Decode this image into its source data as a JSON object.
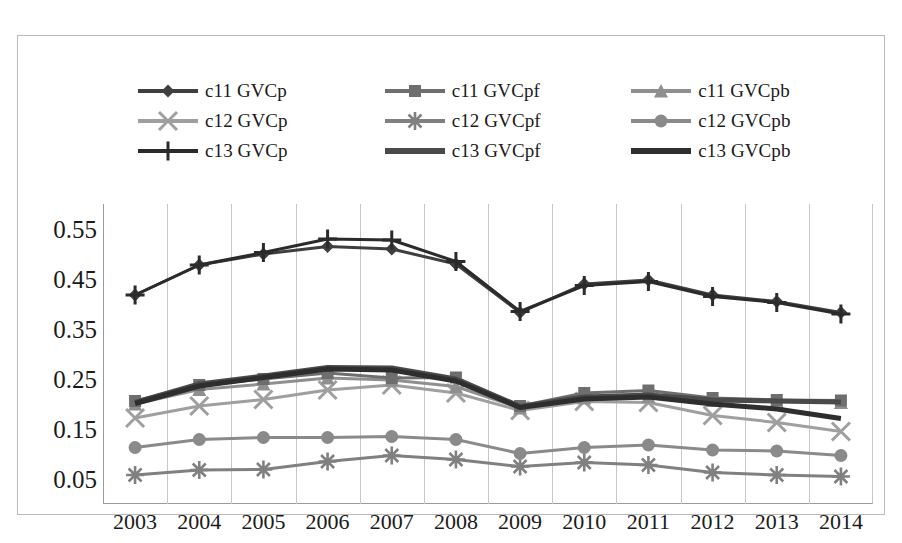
{
  "chart_data": {
    "type": "line",
    "title": "",
    "xlabel": "",
    "ylabel": "",
    "categories": [
      "2003",
      "2004",
      "2005",
      "2006",
      "2007",
      "2008",
      "2009",
      "2010",
      "2011",
      "2012",
      "2013",
      "2014"
    ],
    "x": [
      2003,
      2004,
      2005,
      2006,
      2007,
      2008,
      2009,
      2010,
      2011,
      2012,
      2013,
      2014
    ],
    "ylim": [
      0.0,
      0.6
    ],
    "yticks": [
      0.05,
      0.15,
      0.25,
      0.35,
      0.45,
      0.55
    ],
    "ytick_labels": [
      "0.05",
      "0.15",
      "0.25",
      "0.35",
      "0.45",
      "0.55"
    ],
    "grid": "vertical",
    "legend_position": "top",
    "series": [
      {
        "name": "c11 GVCp",
        "marker": "diamond",
        "color": "#3f3f3f",
        "width": 3,
        "values": [
          0.418,
          0.478,
          0.5,
          0.515,
          0.51,
          0.48,
          0.383,
          0.44,
          0.448,
          0.418,
          0.405,
          0.383
        ]
      },
      {
        "name": "c11 GVCpf",
        "marker": "square",
        "color": "#6e6e6e",
        "width": 3,
        "values": [
          0.206,
          0.238,
          0.25,
          0.262,
          0.252,
          0.253,
          0.196,
          0.222,
          0.227,
          0.212,
          0.208,
          0.207
        ]
      },
      {
        "name": "c11 GVCpb",
        "marker": "triangle",
        "color": "#8f8f8f",
        "width": 3,
        "values": [
          0.2,
          0.229,
          0.24,
          0.252,
          0.248,
          0.235,
          0.192,
          0.212,
          0.215,
          0.207,
          0.205,
          0.203
        ]
      },
      {
        "name": "c12 GVCp",
        "marker": "x",
        "color": "#9f9f9f",
        "width": 3,
        "values": [
          0.172,
          0.196,
          0.209,
          0.228,
          0.238,
          0.222,
          0.187,
          0.205,
          0.203,
          0.177,
          0.163,
          0.145
        ]
      },
      {
        "name": "c12 GVCpf",
        "marker": "asterisk",
        "color": "#808080",
        "width": 3,
        "values": [
          0.058,
          0.068,
          0.069,
          0.085,
          0.097,
          0.089,
          0.075,
          0.083,
          0.078,
          0.063,
          0.058,
          0.055
        ]
      },
      {
        "name": "c12 GVCpb",
        "marker": "circle",
        "color": "#8a8a8a",
        "width": 3,
        "values": [
          0.113,
          0.129,
          0.133,
          0.133,
          0.135,
          0.129,
          0.101,
          0.113,
          0.118,
          0.108,
          0.106,
          0.097
        ]
      },
      {
        "name": "c13 GVCp",
        "marker": "plus",
        "color": "#2b2b2b",
        "width": 3,
        "values": [
          0.418,
          0.478,
          0.503,
          0.53,
          0.528,
          0.485,
          0.385,
          0.437,
          0.445,
          0.415,
          0.403,
          0.38
        ]
      },
      {
        "name": "c13 GVCpf",
        "marker": "none",
        "color": "#4a4a4a",
        "width": 5,
        "values": [
          0.203,
          0.24,
          0.256,
          0.273,
          0.272,
          0.25,
          0.195,
          0.214,
          0.218,
          0.208,
          0.206,
          0.204
        ]
      },
      {
        "name": "c13 GVCpb",
        "marker": "none",
        "color": "#2e2e2e",
        "width": 5,
        "values": [
          0.201,
          0.236,
          0.253,
          0.27,
          0.268,
          0.246,
          0.193,
          0.21,
          0.214,
          0.2,
          0.19,
          0.171
        ]
      }
    ]
  },
  "legend": {
    "items": [
      {
        "label": "c11 GVCp",
        "series": 0
      },
      {
        "label": "c11 GVCpf",
        "series": 1
      },
      {
        "label": "c11 GVCpb",
        "series": 2
      },
      {
        "label": "c12 GVCp",
        "series": 3
      },
      {
        "label": "c12 GVCpf",
        "series": 4
      },
      {
        "label": "c12 GVCpb",
        "series": 5
      },
      {
        "label": "c13 GVCp",
        "series": 6
      },
      {
        "label": "c13 GVCpf",
        "series": 7
      },
      {
        "label": "c13 GVCpb",
        "series": 8
      }
    ]
  },
  "colors": {
    "grid": "#c6c6c6",
    "frame": "#b9b9b9",
    "text": "#1a1a1a",
    "background": "#ffffff"
  }
}
